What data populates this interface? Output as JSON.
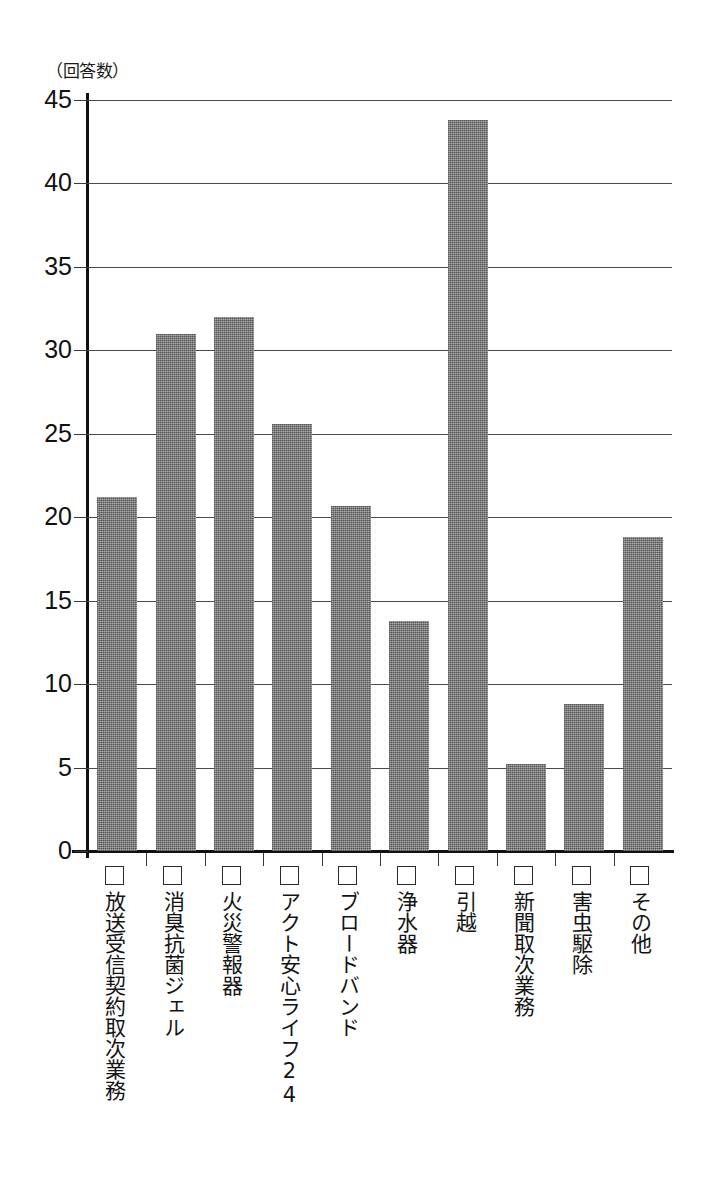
{
  "chart_data": {
    "type": "bar",
    "title": "",
    "subtitle": "",
    "xlabel": "",
    "ylabel": "（回答数）",
    "ylim": [
      0,
      45
    ],
    "ytick_step": 5,
    "yticks": [
      "45",
      "40",
      "35",
      "30",
      "25",
      "20",
      "15",
      "10",
      "5",
      "0"
    ],
    "grid": true,
    "legend": "none",
    "bar_color": "#8a8a8a",
    "axis_color": "#111111",
    "categories": [
      "放送受信契約取次業務",
      "消臭抗菌ジェル",
      "火災警報器",
      "アクト安心ライフ24",
      "ブロードバンド",
      "浄水器",
      "引越",
      "新聞取次業務",
      "害虫駆除",
      "その他"
    ],
    "values": [
      21.2,
      31.0,
      32.0,
      25.6,
      20.7,
      13.8,
      43.8,
      5.2,
      8.8,
      18.8
    ],
    "category_markers": [
      "□",
      "□",
      "□",
      "□",
      "□",
      "□",
      "□",
      "□",
      "□",
      "□"
    ]
  }
}
